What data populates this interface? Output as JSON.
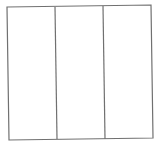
{
  "diagram": {
    "type": "rectangle-divided-into-vertical-strips",
    "strip_count": 3,
    "stroke_color": "#707070",
    "stroke_width": 1.2,
    "background": "#ffffff",
    "outline": {
      "top_left": [
        7,
        7
      ],
      "top_right": [
        151,
        5
      ],
      "bottom_right": [
        153,
        138
      ],
      "bottom_left": [
        9,
        140
      ]
    },
    "dividers": [
      {
        "top": [
          55,
          7
        ],
        "bottom": [
          57,
          139
        ]
      },
      {
        "top": [
          103,
          6
        ],
        "bottom": [
          105,
          139
        ]
      }
    ],
    "cells": [
      {
        "label": ""
      },
      {
        "label": ""
      },
      {
        "label": ""
      }
    ]
  }
}
